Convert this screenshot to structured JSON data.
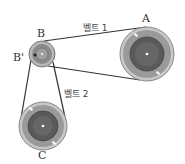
{
  "diagram": {
    "pulleys": [
      {
        "id": "A",
        "label": "A",
        "cx": 147,
        "cy": 54,
        "r": 27
      },
      {
        "id": "B",
        "label": "B",
        "cx": 42,
        "cy": 54,
        "r": 13
      },
      {
        "id": "C",
        "label": "C",
        "cx": 43,
        "cy": 126,
        "r": 24
      }
    ],
    "point_label": "B'",
    "belts": [
      {
        "label": "벨트 1",
        "connects": [
          "B",
          "A"
        ]
      },
      {
        "label": "벨트 2",
        "connects": [
          "B",
          "C"
        ]
      }
    ],
    "colors": {
      "rim": "#b5b5b5",
      "ring": "#8a8a8a",
      "hub": "#555555",
      "belt": "#333333"
    }
  }
}
